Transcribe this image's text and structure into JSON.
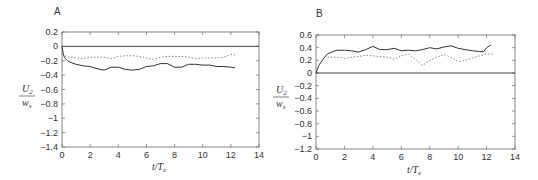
{
  "chart_data": [
    {
      "type": "line",
      "panel": "A",
      "title": "A",
      "xlabel": "t/T_e",
      "ylabel": "U_2 / w_s",
      "xlim": [
        0,
        14
      ],
      "ylim": [
        -1.4,
        0.2
      ],
      "xticks": [
        "0",
        "2",
        "4",
        "6",
        "8",
        "10",
        "12",
        "14"
      ],
      "yticks": [
        "0.2",
        "0",
        "-0.2",
        "-0.4",
        "-0.6",
        "-0.8",
        "-1",
        "-1.2",
        "-1.4"
      ],
      "grid": false,
      "series": [
        {
          "name": "solid",
          "style": "solid",
          "x": [
            0,
            0.1,
            0.2,
            0.4,
            0.7,
            1,
            1.5,
            2,
            2.5,
            3,
            3.5,
            4,
            4.5,
            5,
            5.5,
            6,
            6.5,
            7,
            7.5,
            8,
            8.5,
            9,
            9.5,
            10,
            10.5,
            11,
            11.5,
            12,
            12.3
          ],
          "y": [
            0,
            -0.12,
            -0.16,
            -0.2,
            -0.23,
            -0.25,
            -0.27,
            -0.28,
            -0.31,
            -0.33,
            -0.29,
            -0.29,
            -0.32,
            -0.33,
            -0.32,
            -0.28,
            -0.27,
            -0.24,
            -0.24,
            -0.29,
            -0.29,
            -0.25,
            -0.25,
            -0.26,
            -0.26,
            -0.28,
            -0.28,
            -0.29,
            -0.3
          ]
        },
        {
          "name": "dotted",
          "style": "dotted",
          "x": [
            0,
            0.1,
            0.2,
            0.4,
            0.7,
            1,
            1.5,
            2,
            2.5,
            3,
            3.5,
            4,
            4.5,
            5,
            5.5,
            6,
            6.5,
            7,
            7.5,
            8,
            8.5,
            9,
            9.5,
            10,
            10.5,
            11,
            11.5,
            12,
            12.3
          ],
          "y": [
            0,
            -0.1,
            -0.13,
            -0.15,
            -0.15,
            -0.16,
            -0.17,
            -0.15,
            -0.15,
            -0.15,
            -0.17,
            -0.14,
            -0.13,
            -0.13,
            -0.14,
            -0.16,
            -0.18,
            -0.15,
            -0.14,
            -0.14,
            -0.14,
            -0.15,
            -0.17,
            -0.16,
            -0.16,
            -0.16,
            -0.15,
            -0.11,
            -0.12
          ]
        }
      ]
    },
    {
      "type": "line",
      "panel": "B",
      "title": "B",
      "xlabel": "t/T_e",
      "ylabel": "U_2 / w_s",
      "xlim": [
        0,
        14
      ],
      "ylim": [
        -1.2,
        0.6
      ],
      "xticks": [
        "0",
        "2",
        "4",
        "6",
        "8",
        "10",
        "12",
        "14"
      ],
      "yticks": [
        "0.6",
        "0.4",
        "0.2",
        "0",
        "-0.2",
        "-0.4",
        "-0.6",
        "-0.8",
        "-1",
        "-1.2"
      ],
      "grid": false,
      "series": [
        {
          "name": "solid",
          "style": "solid",
          "x": [
            0,
            0.2,
            0.5,
            0.8,
            1.2,
            1.5,
            2,
            2.5,
            3,
            3.5,
            4,
            4.5,
            5,
            5.5,
            6,
            6.5,
            7,
            7.5,
            8,
            8.5,
            9,
            9.5,
            10,
            10.5,
            11,
            11.5,
            11.8,
            12,
            12.3
          ],
          "y": [
            0,
            0.12,
            0.22,
            0.3,
            0.34,
            0.36,
            0.36,
            0.35,
            0.33,
            0.37,
            0.42,
            0.37,
            0.37,
            0.39,
            0.35,
            0.36,
            0.35,
            0.37,
            0.4,
            0.38,
            0.41,
            0.43,
            0.39,
            0.37,
            0.35,
            0.34,
            0.34,
            0.4,
            0.44
          ]
        },
        {
          "name": "dotted",
          "style": "dotted",
          "x": [
            0.8,
            1,
            1.5,
            2,
            2.5,
            3,
            3.5,
            4,
            4.5,
            5,
            5.5,
            6,
            6.5,
            7,
            7.5,
            8,
            8.5,
            9,
            9.5,
            10,
            10.5,
            11,
            11.5,
            12,
            12.5
          ],
          "y": [
            0.25,
            0.25,
            0.25,
            0.23,
            0.25,
            0.26,
            0.28,
            0.27,
            0.26,
            0.25,
            0.22,
            0.27,
            0.3,
            0.22,
            0.12,
            0.2,
            0.25,
            0.29,
            0.25,
            0.18,
            0.2,
            0.24,
            0.27,
            0.3,
            0.3
          ]
        }
      ]
    }
  ],
  "panels": {
    "a": {
      "label": "A",
      "xlabel_main": "t/T",
      "xlabel_sub": "e",
      "ylabel_num": "U",
      "ylabel_num_sub": "2",
      "ylabel_den": "w",
      "ylabel_den_sub": "s"
    },
    "b": {
      "label": "B",
      "xlabel_main": "t/T",
      "xlabel_sub": "e",
      "ylabel_num": "U",
      "ylabel_num_sub": "2",
      "ylabel_den": "w",
      "ylabel_den_sub": "s"
    }
  },
  "colors": {
    "line": "#333333",
    "axis": "#555555",
    "dotted": "#777777"
  }
}
